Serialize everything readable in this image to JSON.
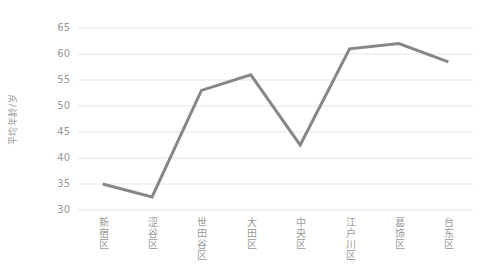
{
  "chart_data": {
    "type": "line",
    "title": "",
    "xlabel": "",
    "ylabel": "平均年龄/岁",
    "categories": [
      "新宿区",
      "涩谷区",
      "世田谷区",
      "大田区",
      "中央区",
      "江户川区",
      "葛饰区",
      "台东区"
    ],
    "values": [
      35,
      32.5,
      53,
      56,
      42.5,
      61,
      62,
      58.5
    ],
    "ylim": [
      30,
      65
    ],
    "yticks": [
      30,
      35,
      40,
      45,
      50,
      55,
      60,
      65
    ],
    "grid": "horizontal",
    "legend": "none",
    "colors": {
      "line": "#878787",
      "grid": "#e6e6e6",
      "tick_text": "#999999",
      "background": "#ffffff"
    }
  }
}
